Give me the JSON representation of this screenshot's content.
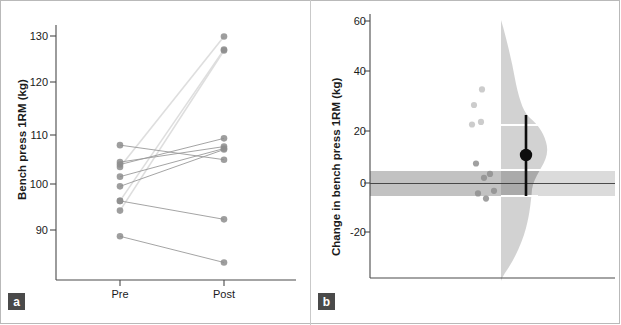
{
  "figure": {
    "panels": [
      {
        "id": "a",
        "label": "a",
        "ylabel": "Bench press 1RM (kg)",
        "xlabel": "",
        "xticks": [
          "Pre",
          "Post"
        ]
      },
      {
        "id": "b",
        "label": "b",
        "ylabel": "Change in bench press 1RM (kg)",
        "xlabel": "",
        "xticks": []
      }
    ]
  },
  "chart_data": [
    {
      "type": "line",
      "title": "",
      "panel": "a",
      "xlabel": "",
      "ylabel": "Bench press 1RM (kg)",
      "categories": [
        "Pre",
        "Post"
      ],
      "yticks": [
        90,
        100,
        110,
        120,
        130
      ],
      "ylim": [
        82,
        132
      ],
      "grid": false,
      "legend": "none",
      "series": [
        {
          "name": "P1",
          "values": [
            103.0,
            129.9
          ]
        },
        {
          "name": "P2",
          "values": [
            96.0,
            127.2
          ]
        },
        {
          "name": "P3",
          "values": [
            94.0,
            127.0
          ]
        },
        {
          "name": "P4",
          "values": [
            103.5,
            108.9
          ]
        },
        {
          "name": "P5",
          "values": [
            104.0,
            107.2
          ]
        },
        {
          "name": "P6",
          "values": [
            101.0,
            106.8
          ]
        },
        {
          "name": "P7",
          "values": [
            99.0,
            106.6
          ]
        },
        {
          "name": "P8",
          "values": [
            107.5,
            104.5
          ]
        },
        {
          "name": "P9",
          "values": [
            96.0,
            92.2
          ]
        },
        {
          "name": "P10",
          "values": [
            88.7,
            83.3
          ]
        }
      ]
    },
    {
      "type": "scatter",
      "title": "",
      "panel": "b",
      "xlabel": "",
      "ylabel": "Change in bench press 1RM (kg)",
      "yticks": [
        -20,
        0,
        20,
        40,
        60
      ],
      "ylim": [
        -32,
        64
      ],
      "grid": false,
      "legend": "none",
      "zero_line": 0,
      "rope_band": [
        -5,
        5
      ],
      "values": [
        36.0,
        30.0,
        23.5,
        22.5,
        7.5,
        3.5,
        2.0,
        -3.0,
        -4.0,
        -6.0
      ],
      "estimate": {
        "mean": 11.0,
        "ci_low": -4.0,
        "ci_high": 26.5
      },
      "hdi_band": [
        -2.0,
        23.0
      ],
      "density": {
        "note": "posterior density, mirrored right of vertical axis",
        "peak_y": 23.0
      }
    }
  ]
}
